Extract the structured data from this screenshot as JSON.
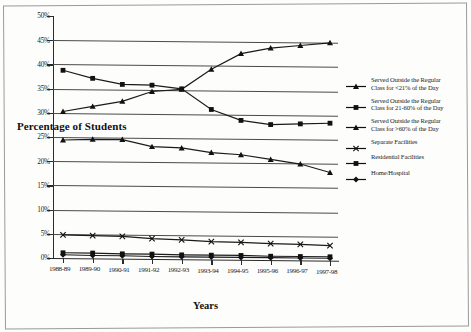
{
  "chart_data": {
    "type": "line",
    "title": "",
    "xlabel": "Years",
    "ylabel": "Percentage of Students",
    "categories": [
      "1988-89",
      "1989-90",
      "1990-91",
      "1991-92",
      "1992-93",
      "1993-94",
      "1994-95",
      "1995-96",
      "1996-97",
      "1997-98"
    ],
    "ylim": [
      0,
      50
    ],
    "ytick_labels": [
      "0%",
      "5%",
      "10%",
      "15%",
      "20%",
      "25%",
      "30%",
      "35%",
      "40%",
      "45%",
      "50%"
    ],
    "ytick_values": [
      0,
      5,
      10,
      15,
      20,
      25,
      30,
      35,
      40,
      45,
      50
    ],
    "grid": true,
    "legend_position": "right",
    "series": [
      {
        "name": "Served Outside the Regular Class for <21% of the Day",
        "name_line1": "Served Outside the Regular",
        "name_line2": "Class for <21% of the Day",
        "marker": "triangle",
        "values": [
          30.3,
          31.4,
          32.5,
          34.6,
          35.1,
          39.3,
          42.6,
          43.8,
          44.4,
          45.0
        ]
      },
      {
        "name": "Served Outside the Regular Class for 21-60% of the Day",
        "name_line1": "Served Outside the Regular",
        "name_line2": "Class for 21-60% of the Day",
        "marker": "square",
        "values": [
          38.8,
          37.2,
          36.0,
          35.9,
          35.2,
          31.0,
          28.8,
          28.0,
          28.2,
          28.4
        ]
      },
      {
        "name": "Served Outside the Regular Class for >60% of the Day",
        "name_line1": "Served Outside the Regular",
        "name_line2": "Class for >60% of the Day",
        "marker": "triangle",
        "values": [
          24.4,
          24.6,
          24.6,
          23.2,
          23.0,
          22.1,
          21.7,
          20.8,
          19.9,
          18.2
        ]
      },
      {
        "name": "Separate Facilities",
        "name_line1": "Separate Facilities",
        "name_line2": "",
        "marker": "cross",
        "values": [
          4.8,
          4.7,
          4.6,
          4.2,
          4.0,
          3.7,
          3.6,
          3.4,
          3.3,
          3.1
        ]
      },
      {
        "name": "Residential Facilities",
        "name_line1": "Residential Facilities",
        "name_line2": "",
        "marker": "square",
        "values": [
          1.1,
          1.1,
          1.0,
          1.0,
          0.9,
          0.9,
          0.9,
          0.8,
          0.8,
          0.8
        ]
      },
      {
        "name": "Home/Hospital",
        "name_line1": "Home/Hospital",
        "name_line2": "",
        "marker": "diamond",
        "values": [
          0.7,
          0.6,
          0.6,
          0.5,
          0.5,
          0.5,
          0.5,
          0.5,
          0.5,
          0.5
        ]
      }
    ],
    "colors": {
      "line": "#1a1a1a",
      "grid": "#4a4a4a",
      "axis": "#2b2b2b",
      "background": "#fdfdfc"
    }
  }
}
